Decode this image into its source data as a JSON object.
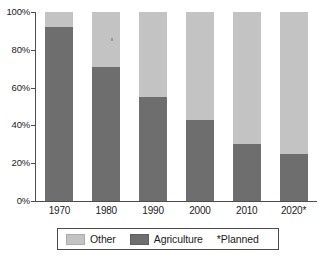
{
  "chart_data": {
    "type": "bar",
    "subtype": "stacked-100-percent",
    "title": "",
    "xlabel": "",
    "ylabel": "",
    "categories": [
      "1970",
      "1980",
      "1990",
      "2000",
      "2010",
      "2020*"
    ],
    "series": [
      {
        "name": "Agriculture",
        "color": "#6e6e6e",
        "values": [
          92,
          71,
          55,
          43,
          30,
          25
        ]
      },
      {
        "name": "Other",
        "color": "#c3c3c3",
        "values": [
          8,
          29,
          45,
          57,
          70,
          75
        ]
      }
    ],
    "ylim": [
      0,
      100
    ],
    "yticks": [
      0,
      20,
      40,
      60,
      80,
      100
    ],
    "ytick_labels": [
      "0%",
      "20%",
      "40%",
      "60%",
      "80%",
      "100%"
    ],
    "grid": false,
    "legend_position": "bottom",
    "value_unit": "%"
  },
  "axes": {
    "y_ticks": [
      {
        "label": "100%",
        "value": 100
      },
      {
        "label": "80%",
        "value": 80
      },
      {
        "label": "60%",
        "value": 60
      },
      {
        "label": "40%",
        "value": 40
      },
      {
        "label": "20%",
        "value": 20
      },
      {
        "label": "0%",
        "value": 0
      }
    ],
    "x_ticks": [
      {
        "label": "1970"
      },
      {
        "label": "1980"
      },
      {
        "label": "1990"
      },
      {
        "label": "2000"
      },
      {
        "label": "2010"
      },
      {
        "label": "2020*"
      }
    ]
  },
  "legend": {
    "items": [
      {
        "label": "Other",
        "color": "#c3c3c3"
      },
      {
        "label": "Agriculture",
        "color": "#6e6e6e"
      }
    ],
    "note": "*Planned"
  },
  "colors": {
    "other": "#c3c3c3",
    "agriculture": "#6e6e6e",
    "axis": "#4d4d4d",
    "text": "#1a1a1a",
    "background": "#ffffff"
  }
}
